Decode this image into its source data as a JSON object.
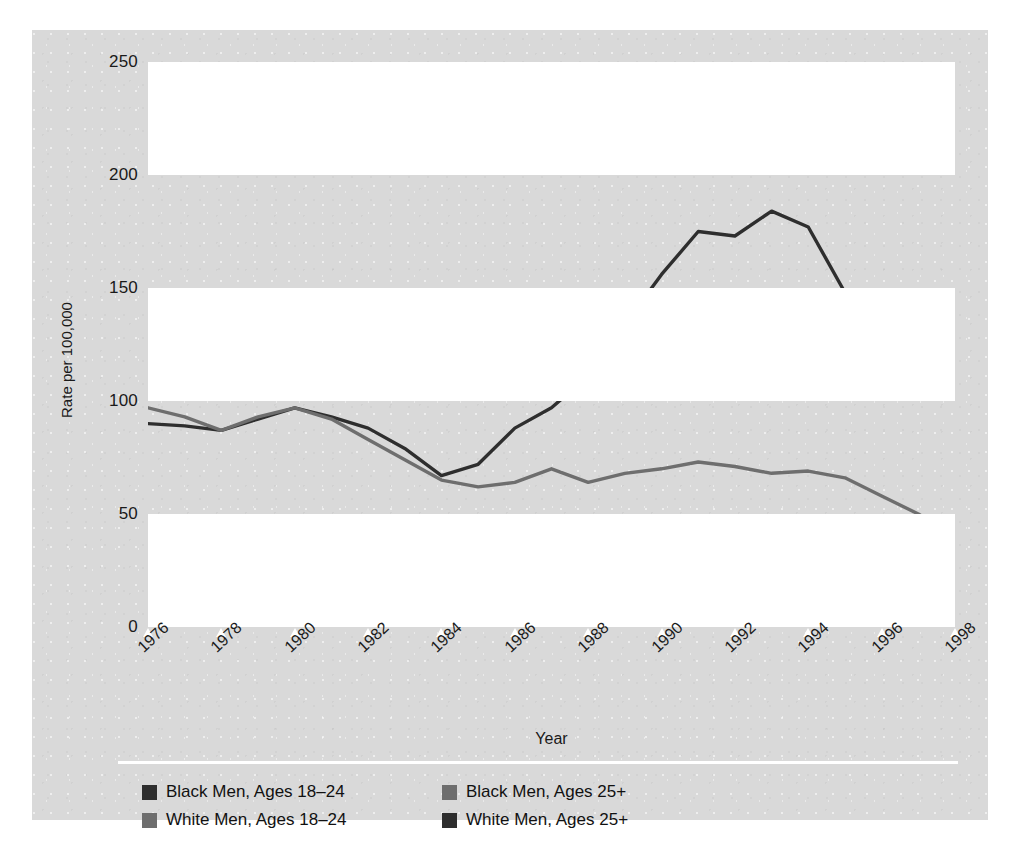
{
  "chart_data": {
    "type": "line",
    "title": "",
    "xlabel": "Year",
    "ylabel": "Rate per 100,000",
    "xlim": [
      1976,
      1998
    ],
    "ylim": [
      0,
      250
    ],
    "yticks": [
      0,
      50,
      100,
      150,
      200,
      250
    ],
    "xticks": [
      1976,
      1978,
      1980,
      1982,
      1984,
      1986,
      1988,
      1990,
      1992,
      1994,
      1996,
      1998
    ],
    "x": [
      1976,
      1977,
      1978,
      1979,
      1980,
      1981,
      1982,
      1983,
      1984,
      1985,
      1986,
      1987,
      1988,
      1989,
      1990,
      1991,
      1992,
      1993,
      1994,
      1995,
      1996,
      1997,
      1998
    ],
    "grid": "horizontal-bands",
    "legend_position": "bottom",
    "series": [
      {
        "name": "Black Men, Ages 18-24",
        "color": "#2e2e2e",
        "values": [
          90,
          89,
          87,
          92,
          97,
          93,
          88,
          79,
          67,
          72,
          88,
          97,
          111,
          134,
          156,
          175,
          173,
          184,
          177,
          148,
          140,
          137,
          118
        ]
      },
      {
        "name": "Black Men, Ages 25+",
        "color": "#6e6e6e",
        "values": [
          97,
          93,
          87,
          93,
          97,
          92,
          83,
          74,
          65,
          62,
          64,
          70,
          64,
          68,
          70,
          73,
          71,
          68,
          69,
          66,
          58,
          50,
          40
        ]
      },
      {
        "name": "White Men, Ages 18-24",
        "color": "#6e6e6e",
        "values": [
          12,
          13,
          14,
          15,
          16,
          16,
          15,
          14,
          13,
          13,
          14,
          14,
          13,
          14,
          16,
          18,
          18,
          18,
          18,
          17,
          16,
          15,
          15
        ]
      },
      {
        "name": "White Men, Ages 25+",
        "color": "#2e2e2e",
        "values": [
          11,
          12,
          12,
          13,
          13,
          13,
          12,
          12,
          11,
          11,
          11,
          11,
          11,
          11,
          11,
          11,
          11,
          11,
          10,
          10,
          9,
          9,
          8
        ]
      }
    ]
  },
  "axis": {
    "ylabel": "Rate per 100,000",
    "xlabel": "Year"
  },
  "legend": {
    "items": [
      {
        "label": "Black Men, Ages 18–24",
        "color": "#2e2e2e"
      },
      {
        "label": "Black Men, Ages 25+",
        "color": "#6e6e6e"
      },
      {
        "label": "White Men, Ages 18–24",
        "color": "#6e6e6e"
      },
      {
        "label": "White Men, Ages 25+",
        "color": "#2e2e2e"
      }
    ]
  }
}
